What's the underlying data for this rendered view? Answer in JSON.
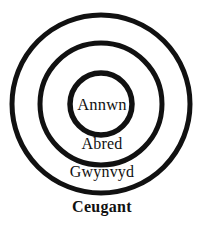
{
  "diagram": {
    "type": "concentric-circles",
    "title": "Ceugant",
    "background_color": "#ffffff",
    "stroke_color": "#111111",
    "text_color": "#111111",
    "center": {
      "x": 101,
      "y": 104
    },
    "rings": [
      {
        "name": "annwn",
        "label": "Annwn",
        "level": 1,
        "radius": 0,
        "stroke_width": 0,
        "label_position": "center"
      },
      {
        "name": "abred",
        "label": "Abred",
        "level": 2,
        "radius": 31,
        "stroke_width": 5.5,
        "label_position": "below-inner-circle"
      },
      {
        "name": "gwynvyd",
        "label": "Gwynvyd",
        "level": 3,
        "radius": 61,
        "stroke_width": 5,
        "label_position": "below-middle-circle"
      },
      {
        "name": "ceugant",
        "label": "Ceugant",
        "level": 4,
        "radius": 89,
        "stroke_width": 5,
        "label_position": "below-outer-circle"
      }
    ]
  }
}
